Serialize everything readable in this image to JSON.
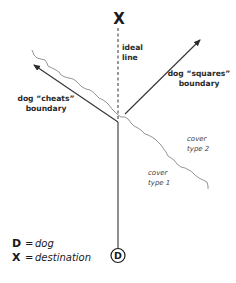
{
  "diagram": {
    "destination_marker": "X",
    "dog_marker": "D",
    "ideal_line_label": {
      "line1": "ideal",
      "line2": "line"
    },
    "squares_label": {
      "line1": "dog “squares”",
      "line2": "boundary"
    },
    "cheats_label": {
      "line1": "dog “cheats”",
      "line2": "boundary"
    },
    "cover_type_2": {
      "line1": "cover",
      "line2": "type 2"
    },
    "cover_type_1": {
      "line1": "cover",
      "line2": "type 1"
    },
    "colors": {
      "line": "#333333",
      "boundary": "#7a7a7a",
      "text": "#1a1a1a"
    }
  },
  "legend": [
    {
      "symbol": "D",
      "equals": "=",
      "meaning": "dog"
    },
    {
      "symbol": "X",
      "equals": "=",
      "meaning": "destination"
    }
  ]
}
